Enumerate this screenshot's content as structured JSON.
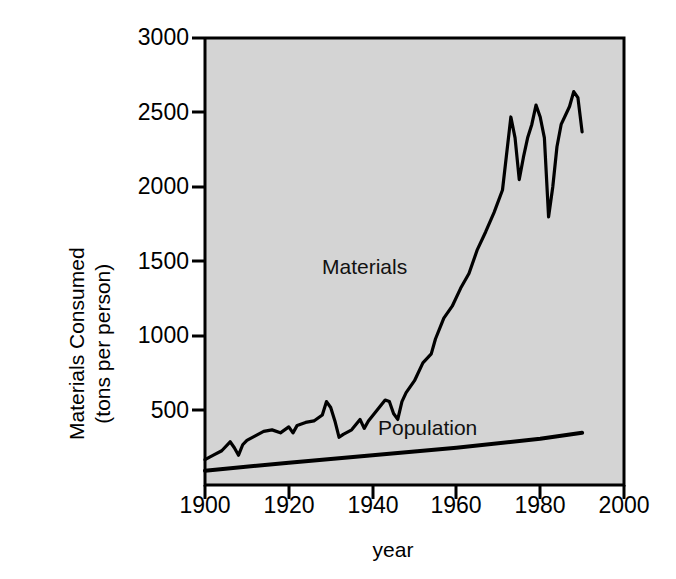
{
  "chart_data": {
    "type": "line",
    "title": "",
    "xlabel": "year",
    "ylabel": "Materials Consumed (tons per person)",
    "ylabel_line1": "Materials Consumed",
    "ylabel_line2": "(tons per person)",
    "xlim": [
      1900,
      2000
    ],
    "ylim": [
      0,
      3000
    ],
    "grid": false,
    "legend_position": "inline-annotations",
    "background_color": "#d4d4d4",
    "line_color": "#000000",
    "xticks": [
      1900,
      1920,
      1940,
      1960,
      1980,
      2000
    ],
    "xtick_labels": [
      "1900",
      "1920",
      "1940",
      "1960",
      "1980",
      "2000"
    ],
    "yticks": [
      500,
      1000,
      1500,
      2000,
      2500,
      3000
    ],
    "ytick_labels": [
      "500",
      "1000",
      "1500",
      "2000",
      "2500",
      "3000"
    ],
    "annotations": [
      {
        "text": "Materials",
        "x": 1944,
        "y": 1250
      },
      {
        "text": "Population",
        "x": 1952,
        "y": 290
      }
    ],
    "series": [
      {
        "name": "Materials",
        "label": "Materials",
        "x": [
          1900,
          1902,
          1904,
          1906,
          1907,
          1908,
          1909,
          1910,
          1912,
          1914,
          1916,
          1918,
          1920,
          1921,
          1922,
          1924,
          1926,
          1928,
          1929,
          1930,
          1931,
          1932,
          1933,
          1935,
          1937,
          1938,
          1939,
          1941,
          1943,
          1944,
          1945,
          1946,
          1947,
          1948,
          1950,
          1952,
          1954,
          1955,
          1957,
          1959,
          1961,
          1963,
          1965,
          1967,
          1969,
          1971,
          1973,
          1974,
          1975,
          1976,
          1977,
          1978,
          1979,
          1980,
          1981,
          1982,
          1983,
          1984,
          1985,
          1986,
          1987,
          1988,
          1989,
          1990
        ],
        "values": [
          170,
          200,
          230,
          290,
          250,
          200,
          270,
          300,
          330,
          360,
          370,
          350,
          390,
          350,
          400,
          420,
          430,
          470,
          560,
          520,
          430,
          320,
          340,
          370,
          440,
          380,
          430,
          500,
          570,
          560,
          480,
          440,
          560,
          620,
          700,
          820,
          880,
          980,
          1120,
          1200,
          1320,
          1420,
          1580,
          1700,
          1830,
          1980,
          2470,
          2330,
          2050,
          2200,
          2330,
          2420,
          2550,
          2470,
          2330,
          1800,
          2000,
          2270,
          2420,
          2480,
          2540,
          2640,
          2600,
          2370
        ],
        "units": "tons per person"
      },
      {
        "name": "Population",
        "label": "Population",
        "x": [
          1900,
          1920,
          1940,
          1960,
          1980,
          1990
        ],
        "values": [
          95,
          150,
          200,
          250,
          310,
          350
        ],
        "units": "tons per person"
      }
    ]
  },
  "labels": {
    "materials": "Materials",
    "population": "Population"
  }
}
